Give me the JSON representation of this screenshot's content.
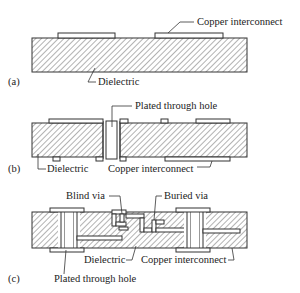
{
  "panels": {
    "a": {
      "label": "(a)",
      "annotations": {
        "copper": "Copper interconnect",
        "dielectric": "Dielectric"
      }
    },
    "b": {
      "label": "(b)",
      "annotations": {
        "through_hole": "Plated through hole",
        "dielectric": "Dielectric",
        "copper": "Copper interconnect"
      }
    },
    "c": {
      "label": "(c)",
      "annotations": {
        "blind_via": "Blind via",
        "buried_via": "Buried via",
        "dielectric": "Dielectric",
        "copper": "Copper interconnect",
        "through_hole": "Plated through hole"
      }
    }
  },
  "colors": {
    "stroke": "#333333",
    "hatch": "#555555",
    "background": "#ffffff"
  }
}
